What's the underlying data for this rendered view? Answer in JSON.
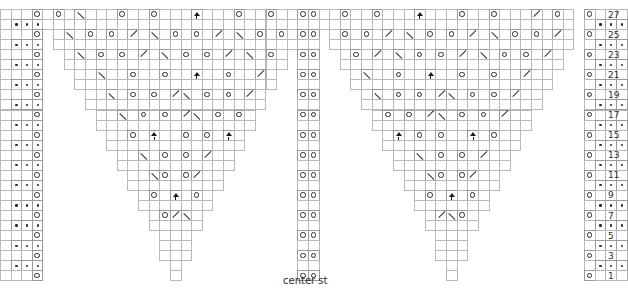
{
  "chart": {
    "title": "",
    "type": "knitting-chart",
    "rows_total": 27,
    "columns_total": 59,
    "cell_width": 10.62,
    "cell_height": 10.05,
    "origin_x": 0,
    "origin_y": 0,
    "row_numbers_shown": [
      27,
      25,
      23,
      21,
      19,
      17,
      15,
      13,
      11,
      9,
      7,
      5,
      3,
      1
    ],
    "row_number_x": 608,
    "caption": {
      "text": "center st",
      "x": 283,
      "y": 276
    },
    "legend_symbols": {
      "yo": "yarn-over",
      "purl": "purl",
      "k2tog": "left-leaning-decrease",
      "ssk": "right-leaning-decrease",
      "cdd": "central-double-decrease"
    },
    "colors": {
      "grid": "#9a9a9a",
      "grid_light": "#b9b9b9",
      "ink": "#2b2b2b",
      "background": "#ffffff"
    },
    "grid": [
      {
        "row": 27,
        "cells": [
          {
            "c": 0,
            "s": "blank"
          },
          {
            "c": 1,
            "s": "purl"
          },
          {
            "c": 2,
            "s": "purl"
          },
          {
            "c": 3,
            "s": "purl"
          },
          {
            "c": 4,
            "s": "blank"
          },
          {
            "c": 5,
            "s": "blank"
          },
          {
            "c": 6,
            "s": "blank"
          },
          {
            "c": 7,
            "s": "blank"
          },
          {
            "c": 8,
            "s": "blank"
          },
          {
            "c": 9,
            "s": "blank"
          },
          {
            "c": 10,
            "s": "blank"
          },
          {
            "c": 11,
            "s": "blank"
          },
          {
            "c": 12,
            "s": "blank"
          },
          {
            "c": 13,
            "s": "blank"
          },
          {
            "c": 14,
            "s": "blank"
          },
          {
            "c": 15,
            "s": "blank"
          },
          {
            "c": 16,
            "s": "blank"
          },
          {
            "c": 17,
            "s": "blank"
          },
          {
            "c": 18,
            "s": "blank"
          },
          {
            "c": 19,
            "s": "blank"
          },
          {
            "c": 20,
            "s": "blank"
          },
          {
            "c": 21,
            "s": "blank"
          },
          {
            "c": 22,
            "s": "blank"
          },
          {
            "c": 23,
            "s": "blank"
          },
          {
            "c": 24,
            "s": "blank"
          },
          {
            "c": 25,
            "s": "blank"
          },
          {
            "c": 26,
            "s": "blank"
          },
          {
            "c": 27,
            "s": "blank"
          }
        ]
      }
    ],
    "rows": [
      {
        "n": 27,
        "y": 9.6
      },
      {
        "n": 26,
        "y": 19.7
      },
      {
        "n": 25,
        "y": 29.8
      },
      {
        "n": 24,
        "y": 39.8
      },
      {
        "n": 23,
        "y": 49.9
      },
      {
        "n": 22,
        "y": 60.0
      },
      {
        "n": 21,
        "y": 70.0
      },
      {
        "n": 20,
        "y": 80.1
      },
      {
        "n": 19,
        "y": 90.2
      },
      {
        "n": 18,
        "y": 100.2
      },
      {
        "n": 17,
        "y": 110.3
      },
      {
        "n": 16,
        "y": 120.4
      },
      {
        "n": 15,
        "y": 130.4
      },
      {
        "n": 14,
        "y": 140.5
      },
      {
        "n": 13,
        "y": 150.6
      },
      {
        "n": 12,
        "y": 160.6
      },
      {
        "n": 11,
        "y": 170.7
      },
      {
        "n": 10,
        "y": 180.8
      },
      {
        "n": 9,
        "y": 190.8
      },
      {
        "n": 8,
        "y": 200.9
      },
      {
        "n": 7,
        "y": 211.0
      },
      {
        "n": 6,
        "y": 221.0
      },
      {
        "n": 5,
        "y": 231.1
      },
      {
        "n": 4,
        "y": 241.2
      },
      {
        "n": 3,
        "y": 251.2
      },
      {
        "n": 2,
        "y": 261.3
      },
      {
        "n": 1,
        "y": 271.4
      }
    ],
    "left_edge": {
      "name": "left-border-panel",
      "purl_columns": [
        1,
        2,
        3
      ],
      "yo_column": 3,
      "description": "Three purl stitches on even rows, single yarn over on odd rows at column 3"
    },
    "right_edge": {
      "name": "right-border-panel",
      "purl_columns": [
        56,
        57,
        58
      ],
      "yo_column": 55,
      "description": "Single yarn over on odd rows at column 55, three purl stitches on even rows"
    },
    "center": {
      "name": "center-stitch-panel",
      "columns": [
        28,
        29
      ],
      "description": "Two column center stitch panel with yarn overs on odd rows"
    },
    "motifs": [
      {
        "name": "left-motif",
        "start_col": 4,
        "end_col": 27
      },
      {
        "name": "right-motif",
        "start_col": 30,
        "end_col": 55
      }
    ]
  }
}
